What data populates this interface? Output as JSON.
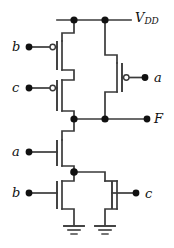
{
  "figure": {
    "kind": "cmos-transistor-schematic",
    "width": 174,
    "height": 248,
    "background": "#ffffff",
    "line_color": "#3a3a3a",
    "node_color": "#111111",
    "text_color": "#111111"
  },
  "labels": {
    "vdd": "V",
    "vdd_sub": "DD",
    "output": "F",
    "pmos_b": "b",
    "pmos_c": "c",
    "pmos_a": "a",
    "nmos_a": "a",
    "nmos_b": "b",
    "nmos_c": "c"
  },
  "nodes": {
    "vdd_rail_left": "vdd-node-left",
    "vdd_rail_right": "vdd-node-right",
    "output_left": "output-node-left",
    "output_mid": "output-node-mid",
    "output_terminal": "output-terminal-dot",
    "nmos_mid": "nmos-series-node"
  },
  "devices": [
    {
      "id": "pmos-b",
      "type": "pmos",
      "gate": "b",
      "branch": "pull-up-series"
    },
    {
      "id": "pmos-c",
      "type": "pmos",
      "gate": "c",
      "branch": "pull-up-series"
    },
    {
      "id": "pmos-a",
      "type": "pmos",
      "gate": "a",
      "branch": "pull-up-parallel"
    },
    {
      "id": "nmos-a",
      "type": "nmos",
      "gate": "a",
      "branch": "pull-down-series"
    },
    {
      "id": "nmos-b",
      "type": "nmos",
      "gate": "b",
      "branch": "pull-down-parallel"
    },
    {
      "id": "nmos-c",
      "type": "nmos",
      "gate": "c",
      "branch": "pull-down-parallel"
    }
  ],
  "grounds": [
    {
      "id": "ground-left"
    },
    {
      "id": "ground-right"
    }
  ]
}
